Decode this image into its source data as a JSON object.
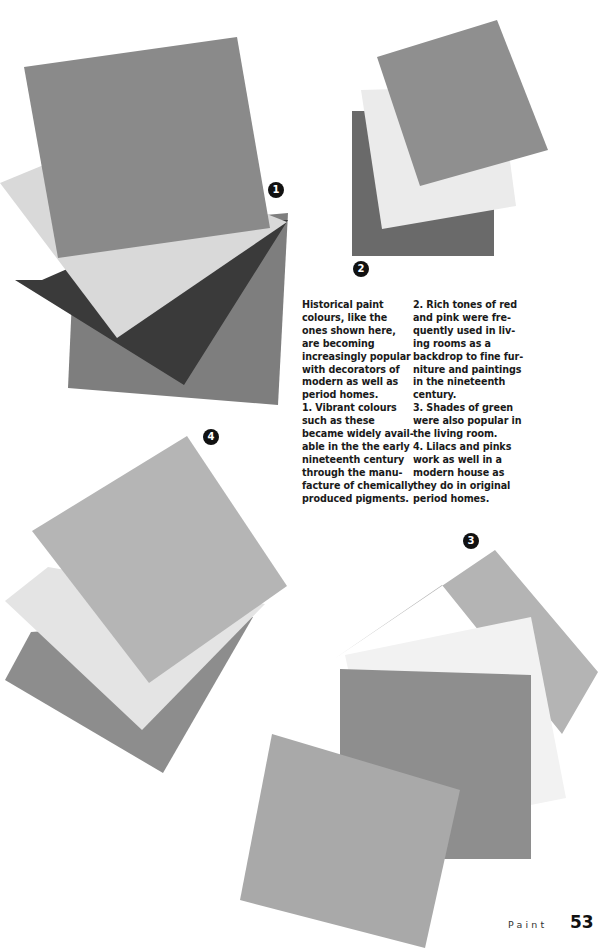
{
  "swatch_groups": [
    {
      "number": "1",
      "badge": {
        "x": 268,
        "y": 182
      },
      "swatches": [
        {
          "name": "mid-grey-back",
          "color": "#7e7e7e",
          "points": "75,232 288,213 278,405 68,388"
        },
        {
          "name": "charcoal",
          "color": "#3a3a3a",
          "points": "42,280 172,223 288,220 184,385 15,280"
        },
        {
          "name": "pale-grey",
          "color": "#d9d9d9",
          "points": "0,183 92,145 287,222 117,338"
        },
        {
          "name": "medium-grey-front",
          "color": "#8a8a8a",
          "points": "24,67 237,37 270,228 58,258"
        }
      ]
    },
    {
      "number": "2",
      "badge": {
        "x": 353,
        "y": 261
      },
      "swatches": [
        {
          "name": "dark-grey",
          "color": "#6a6a6a",
          "points": "352,111 494,111 494,256 352,256"
        },
        {
          "name": "off-white",
          "color": "#ebebeb",
          "points": "361,90 500,86 516,206 382,229"
        },
        {
          "name": "medium-grey",
          "color": "#8f8f8f",
          "points": "377,57 497,20 548,150 420,186"
        }
      ]
    },
    {
      "number": "3",
      "badge": {
        "x": 463,
        "y": 533
      },
      "swatches": [
        {
          "name": "light-grey-back",
          "color": "#b4b4b4",
          "points": "334,659 495,550 598,672 562,734 442,585"
        },
        {
          "name": "white",
          "color": "#f2f2f2",
          "points": "345,655 531,617 566,798 384,834"
        },
        {
          "name": "mid-grey",
          "color": "#8e8e8e",
          "points": "340,669 531,675 531,859 340,859"
        },
        {
          "name": "light-grey-front",
          "color": "#a9a9a9",
          "points": "272,734 460,790 425,948 240,900"
        }
      ]
    },
    {
      "number": "4",
      "badge": {
        "x": 203,
        "y": 429
      },
      "swatches": [
        {
          "name": "mid-grey-back",
          "color": "#8d8d8d",
          "points": "31,632 253,617 163,773 5,680"
        },
        {
          "name": "pale",
          "color": "#e4e4e4",
          "points": "48,567 265,604 142,730 5,601"
        },
        {
          "name": "light-grey-front",
          "color": "#b5b5b5",
          "points": "32,531 187,436 287,586 149,683"
        }
      ]
    }
  ],
  "caption": {
    "left_column": [
      "Historical paint",
      "colours, like the",
      "ones shown here,",
      "are becoming",
      "increasingly popular",
      "with decorators of",
      "modern as well as",
      "period homes.",
      "1. Vibrant colours",
      "such as these",
      "became widely avail-",
      "able in the the early",
      "nineteenth century",
      "through the manu-",
      "facture of chemically",
      "produced pigments."
    ],
    "right_column": [
      "2. Rich tones of red",
      "and pink were fre-",
      "quently used in liv-",
      "ing rooms as a",
      "backdrop to fine fur-",
      "niture and paintings",
      "in the nineteenth",
      "century.",
      "3. Shades of green",
      "were also popular in",
      "the living room.",
      "4. Lilacs and pinks",
      "work as well in a",
      "modern house as",
      "they do in original",
      "period homes."
    ]
  },
  "footer": {
    "section": "Paint",
    "page_number": "53"
  }
}
